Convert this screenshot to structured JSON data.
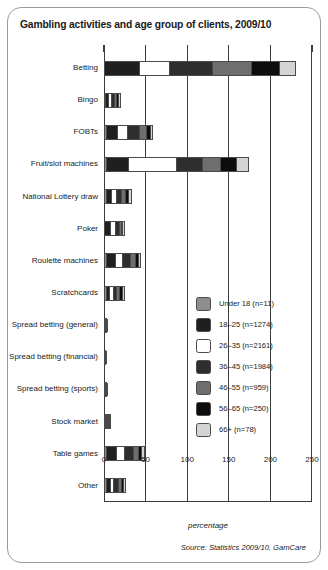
{
  "chart_data": {
    "type": "bar",
    "orientation": "horizontal",
    "stacked": true,
    "title": "Gambling activities and age group of clients, 2009/10",
    "xlabel": "percentage",
    "ylabel": "",
    "source": "Source: Statistics 2009/10, GamCare",
    "xlim": [
      0,
      250
    ],
    "xticks": [
      0,
      50,
      100,
      150,
      200,
      250
    ],
    "grid": true,
    "legend_position": "inside-right",
    "categories": [
      "Betting",
      "Bingo",
      "FOBTs",
      "Fruit/slot machines",
      "National Lottery draw",
      "Poker",
      "Roulette machines",
      "Scratchcards",
      "Spread betting (general)",
      "Spread betting (financial)",
      "Spread betting (sports)",
      "Stock market",
      "Table games",
      "Other"
    ],
    "series": [
      {
        "name": "Under 18 (n=11)",
        "color": "#8e8e8e",
        "values": [
          0,
          1,
          1,
          1,
          1,
          0,
          1,
          1,
          0,
          0,
          0,
          1,
          1,
          1
        ]
      },
      {
        "name": "18–25 (n=1274)",
        "color": "#1f1f1f",
        "values": [
          42,
          4,
          15,
          27,
          8,
          9,
          13,
          5,
          1,
          0,
          1,
          1,
          14,
          6
        ]
      },
      {
        "name": "26–35 (n=2161)",
        "color": "#ffffff",
        "values": [
          37,
          4,
          12,
          60,
          6,
          7,
          9,
          5,
          1,
          1,
          1,
          1,
          11,
          5
        ]
      },
      {
        "name": "36–45 (n=1984)",
        "color": "#2e2e2e",
        "values": [
          52,
          4,
          17,
          31,
          7,
          5,
          11,
          5,
          1,
          1,
          1,
          1,
          11,
          6
        ]
      },
      {
        "name": "46–55 (n=959)",
        "color": "#6e6e6e",
        "values": [
          47,
          3,
          8,
          22,
          5,
          2,
          6,
          4,
          1,
          1,
          1,
          2,
          6,
          4
        ]
      },
      {
        "name": "56–65 (n=250)",
        "color": "#0d0d0d",
        "values": [
          34,
          2,
          4,
          19,
          4,
          1,
          3,
          3,
          0,
          0,
          0,
          1,
          4,
          3
        ]
      },
      {
        "name": "66+ (n=78)",
        "color": "#d4d4d4",
        "values": [
          19,
          2,
          2,
          14,
          3,
          1,
          2,
          2,
          0,
          0,
          0,
          1,
          2,
          2
        ]
      }
    ],
    "totals": [
      231,
      20,
      59,
      174,
      34,
      25,
      45,
      25,
      4,
      3,
      4,
      8,
      49,
      27
    ]
  }
}
